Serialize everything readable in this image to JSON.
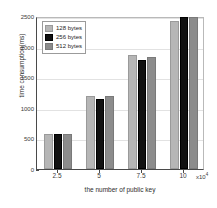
{
  "chart_data": {
    "type": "bar",
    "title": "",
    "xlabel": "the number of public key",
    "ylabel": "time consumption(ms)",
    "x_exponent": "x10",
    "x_exponent_power": "4",
    "categories": [
      "2.5",
      "5",
      "7.5",
      "10"
    ],
    "xticklabels": [
      "2.5",
      "5",
      "7.5",
      "10"
    ],
    "yticklabels": [
      "0",
      "500",
      "1000",
      "1500",
      "2000",
      "2500"
    ],
    "ytickvalues": [
      0,
      500,
      1000,
      1500,
      2000,
      2500
    ],
    "ylim": [
      0,
      2500
    ],
    "grid": true,
    "legend_position": "upper left",
    "series": [
      {
        "name": "128 bytes",
        "color": "#b6b6b6",
        "values": [
          580,
          1190,
          1855,
          2420
        ]
      },
      {
        "name": "256 bytes",
        "color": "#111111",
        "values": [
          580,
          1150,
          1780,
          2490
        ]
      },
      {
        "name": "512 bytes",
        "color": "#8c8c8c",
        "values": [
          580,
          1190,
          1835,
          2490
        ]
      }
    ]
  },
  "legend": {
    "items": [
      {
        "label": "128 bytes"
      },
      {
        "label": "256 bytes"
      },
      {
        "label": "512 bytes"
      }
    ]
  }
}
